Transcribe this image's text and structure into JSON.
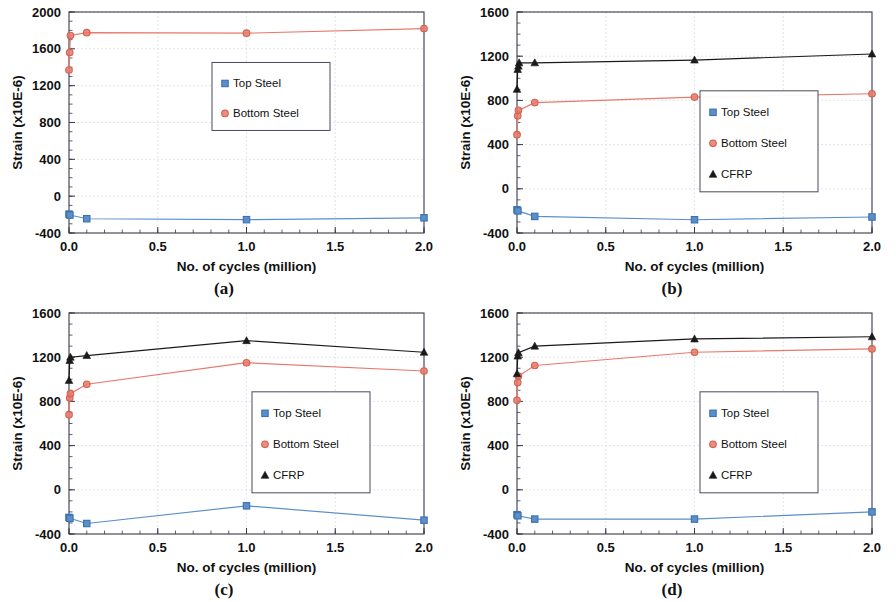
{
  "figure": {
    "panels": [
      {
        "id": "a",
        "caption": "(a)",
        "ylabel": "Strain (x10E-6)",
        "xlabel": "No. of cycles (million)",
        "legend": [
          "Top Steel",
          "Bottom Steel"
        ]
      },
      {
        "id": "b",
        "caption": "(b)",
        "ylabel": "Strain (x10E-6)",
        "xlabel": "No. of cycles (million)",
        "legend": [
          "Top Steel",
          "Bottom Steel",
          "CFRP"
        ]
      },
      {
        "id": "c",
        "caption": "(c)",
        "ylabel": "Strain (x10E-6)",
        "xlabel": "No. of cycles (million)",
        "legend": [
          "Top Steel",
          "Bottom Steel",
          "CFRP"
        ]
      },
      {
        "id": "d",
        "caption": "(d)",
        "ylabel": "Strain (x10E-6)",
        "xlabel": "No. of cycles (million)",
        "legend": [
          "Top Steel",
          "Bottom Steel",
          "CFRP"
        ]
      }
    ]
  },
  "colors": {
    "top_steel": "#5B8FC9",
    "top_steel_marker": "#3A6FB0",
    "bottom_steel": "#E8796B",
    "bottom_steel_marker": "#D2614F",
    "cfrp": "#1a1a1a",
    "frame": "#3a3a4a",
    "grid": "#d9d9e2"
  },
  "chart_data": [
    {
      "type": "line",
      "panel": "a",
      "title": "",
      "xlabel": "No. of cycles (million)",
      "ylabel": "Strain (x10E-6)",
      "xlim": [
        0.0,
        2.0
      ],
      "ylim": [
        -400,
        2000
      ],
      "xticks": [
        0.0,
        0.5,
        1.0,
        1.5,
        2.0
      ],
      "xtick_labels": [
        "0.0",
        "0.5",
        "1.0",
        "1.5",
        "2.0"
      ],
      "yticks": [
        -400,
        0,
        400,
        800,
        1200,
        1600,
        2000
      ],
      "ytick_labels": [
        "-400",
        "0",
        "400",
        "800",
        "1200",
        "1600",
        "2000"
      ],
      "grid": true,
      "legend_position": "center-right",
      "series": [
        {
          "name": "Top Steel",
          "marker": "square",
          "color": "#5B8FC9",
          "x": [
            0.0,
            0.005,
            0.1,
            1.0,
            2.0
          ],
          "values": [
            -195,
            -205,
            -245,
            -255,
            -235
          ]
        },
        {
          "name": "Bottom Steel",
          "marker": "circle",
          "color": "#E8796B",
          "x": [
            0.0,
            0.004,
            0.008,
            0.1,
            1.0,
            2.0
          ],
          "values": [
            1370,
            1560,
            1745,
            1775,
            1770,
            1820
          ]
        }
      ]
    },
    {
      "type": "line",
      "panel": "b",
      "title": "",
      "xlabel": "No. of cycles (million)",
      "ylabel": "Strain (x10E-6)",
      "xlim": [
        0.0,
        2.0
      ],
      "ylim": [
        -400,
        1600
      ],
      "xticks": [
        0.0,
        0.5,
        1.0,
        1.5,
        2.0
      ],
      "xtick_labels": [
        "0.0",
        "0.5",
        "1.0",
        "1.5",
        "2.0"
      ],
      "yticks": [
        -400,
        0,
        400,
        800,
        1200,
        1600
      ],
      "ytick_labels": [
        "-400",
        "0",
        "400",
        "800",
        "1200",
        "1600"
      ],
      "grid": true,
      "legend_position": "center-right",
      "series": [
        {
          "name": "Top Steel",
          "marker": "square",
          "color": "#5B8FC9",
          "x": [
            0.0,
            0.005,
            0.1,
            1.0,
            2.0
          ],
          "values": [
            -190,
            -200,
            -250,
            -280,
            -255
          ]
        },
        {
          "name": "Bottom Steel",
          "marker": "circle",
          "color": "#E8796B",
          "x": [
            0.0,
            0.004,
            0.008,
            0.1,
            1.0,
            2.0
          ],
          "values": [
            490,
            660,
            710,
            780,
            830,
            860
          ]
        },
        {
          "name": "CFRP",
          "marker": "triangle",
          "color": "#1a1a1a",
          "x": [
            0.0,
            0.004,
            0.008,
            0.012,
            0.1,
            1.0,
            2.0
          ],
          "values": [
            900,
            1080,
            1110,
            1140,
            1140,
            1165,
            1220
          ]
        }
      ]
    },
    {
      "type": "line",
      "panel": "c",
      "title": "",
      "xlabel": "No. of cycles (million)",
      "ylabel": "Strain (x10E-6)",
      "xlim": [
        0.0,
        2.0
      ],
      "ylim": [
        -400,
        1600
      ],
      "xticks": [
        0.0,
        0.5,
        1.0,
        1.5,
        2.0
      ],
      "xtick_labels": [
        "0.0",
        "0.5",
        "1.0",
        "1.5",
        "2.0"
      ],
      "yticks": [
        -400,
        0,
        400,
        800,
        1200,
        1600
      ],
      "ytick_labels": [
        "-400",
        "0",
        "400",
        "800",
        "1200",
        "1600"
      ],
      "grid": true,
      "legend_position": "center-right",
      "series": [
        {
          "name": "Top Steel",
          "marker": "square",
          "color": "#5B8FC9",
          "x": [
            0.0,
            0.005,
            0.1,
            1.0,
            2.0
          ],
          "values": [
            -250,
            -258,
            -305,
            -145,
            -275
          ]
        },
        {
          "name": "Bottom Steel",
          "marker": "circle",
          "color": "#E8796B",
          "x": [
            0.0,
            0.004,
            0.008,
            0.1,
            1.0,
            2.0
          ],
          "values": [
            680,
            830,
            870,
            955,
            1150,
            1075
          ]
        },
        {
          "name": "CFRP",
          "marker": "triangle",
          "color": "#1a1a1a",
          "x": [
            0.0,
            0.004,
            0.008,
            0.1,
            1.0,
            2.0
          ],
          "values": [
            990,
            1170,
            1200,
            1215,
            1350,
            1245
          ]
        }
      ]
    },
    {
      "type": "line",
      "panel": "d",
      "title": "",
      "xlabel": "No. of cycles (million)",
      "ylabel": "Strain (x10E-6)",
      "xlim": [
        0.0,
        2.0
      ],
      "ylim": [
        -400,
        1600
      ],
      "xticks": [
        0.0,
        0.5,
        1.0,
        1.5,
        2.0
      ],
      "xtick_labels": [
        "0.0",
        "0.5",
        "1.0",
        "1.5",
        "2.0"
      ],
      "yticks": [
        -400,
        0,
        400,
        800,
        1200,
        1600
      ],
      "ytick_labels": [
        "-400",
        "0",
        "400",
        "800",
        "1200",
        "1600"
      ],
      "grid": true,
      "legend_position": "center-right",
      "series": [
        {
          "name": "Top Steel",
          "marker": "square",
          "color": "#5B8FC9",
          "x": [
            0.0,
            0.005,
            0.1,
            1.0,
            2.0
          ],
          "values": [
            -225,
            -235,
            -265,
            -265,
            -200
          ]
        },
        {
          "name": "Bottom Steel",
          "marker": "circle",
          "color": "#E8796B",
          "x": [
            0.0,
            0.004,
            0.008,
            0.1,
            1.0,
            2.0
          ],
          "values": [
            810,
            970,
            1030,
            1125,
            1245,
            1275
          ]
        },
        {
          "name": "CFRP",
          "marker": "triangle",
          "color": "#1a1a1a",
          "x": [
            0.0,
            0.004,
            0.008,
            0.1,
            1.0,
            2.0
          ],
          "values": [
            1050,
            1210,
            1240,
            1300,
            1365,
            1385
          ]
        }
      ]
    }
  ]
}
